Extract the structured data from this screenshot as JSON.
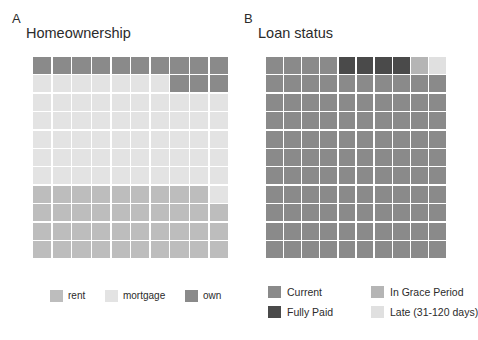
{
  "figure": {
    "background": "#ffffff"
  },
  "panels": [
    {
      "letter": "A",
      "title": "Homeownership",
      "legend": [
        {
          "label": "rent",
          "color": "#bdbdbd"
        },
        {
          "label": "mortgage",
          "color": "#e3e3e3"
        },
        {
          "label": "own",
          "color": "#8a8a8a"
        }
      ]
    },
    {
      "letter": "B",
      "title": "Loan status",
      "legend": [
        {
          "label": "Current",
          "color": "#8a8a8a"
        },
        {
          "label": "In Grace Period",
          "color": "#b5b5b5"
        },
        {
          "label": "Fully Paid",
          "color": "#4a4a4a"
        },
        {
          "label": "Late (31-120 days)",
          "color": "#e0e0e0"
        }
      ]
    }
  ],
  "chart_data": [
    {
      "type": "waffle",
      "title": "Homeownership",
      "panel": "A",
      "rows": 11,
      "columns": 10,
      "total_cells": 110,
      "fill_order": "top-left to bottom-right, row-major",
      "categories": [
        "own",
        "mortgage",
        "rent"
      ],
      "colors": {
        "own": "#8a8a8a",
        "mortgage": "#e3e3e3",
        "rent": "#bdbdbd"
      },
      "counts": {
        "own": 13,
        "mortgage": 57,
        "rent": 40
      },
      "percentages": {
        "own": 11.8,
        "mortgage": 51.8,
        "rent": 36.4
      },
      "cells": [
        "own",
        "own",
        "own",
        "own",
        "own",
        "own",
        "own",
        "own",
        "own",
        "own",
        "mortgage",
        "mortgage",
        "mortgage",
        "mortgage",
        "mortgage",
        "mortgage",
        "mortgage",
        "own",
        "own",
        "own",
        "mortgage",
        "mortgage",
        "mortgage",
        "mortgage",
        "mortgage",
        "mortgage",
        "mortgage",
        "mortgage",
        "mortgage",
        "mortgage",
        "mortgage",
        "mortgage",
        "mortgage",
        "mortgage",
        "mortgage",
        "mortgage",
        "mortgage",
        "mortgage",
        "mortgage",
        "mortgage",
        "mortgage",
        "mortgage",
        "mortgage",
        "mortgage",
        "mortgage",
        "mortgage",
        "mortgage",
        "mortgage",
        "mortgage",
        "mortgage",
        "mortgage",
        "mortgage",
        "mortgage",
        "mortgage",
        "mortgage",
        "mortgage",
        "mortgage",
        "mortgage",
        "mortgage",
        "mortgage",
        "mortgage",
        "mortgage",
        "mortgage",
        "mortgage",
        "mortgage",
        "mortgage",
        "mortgage",
        "mortgage",
        "mortgage",
        "mortgage",
        "rent",
        "rent",
        "rent",
        "rent",
        "rent",
        "rent",
        "rent",
        "rent",
        "rent",
        "mortgage",
        "rent",
        "rent",
        "rent",
        "rent",
        "rent",
        "rent",
        "rent",
        "rent",
        "rent",
        "rent",
        "rent",
        "rent",
        "rent",
        "rent",
        "rent",
        "rent",
        "rent",
        "rent",
        "rent",
        "rent",
        "rent",
        "rent",
        "rent",
        "rent",
        "rent",
        "rent",
        "rent",
        "rent",
        "rent",
        "rent"
      ]
    },
    {
      "type": "waffle",
      "title": "Loan status",
      "panel": "B",
      "rows": 11,
      "columns": 10,
      "total_cells": 110,
      "fill_order": "top-left to bottom-right, row-major",
      "categories": [
        "Current",
        "Fully Paid",
        "In Grace Period",
        "Late (31-120 days)"
      ],
      "colors": {
        "Current": "#8a8a8a",
        "Fully Paid": "#4a4a4a",
        "In Grace Period": "#b5b5b5",
        "Late (31-120 days)": "#e0e0e0"
      },
      "counts": {
        "Current": 104,
        "Fully Paid": 4,
        "In Grace Period": 1,
        "Late (31-120 days)": 1
      },
      "percentages": {
        "Current": 94.5,
        "Fully Paid": 3.6,
        "In Grace Period": 0.9,
        "Late (31-120 days)": 0.9
      },
      "cells": [
        "Current",
        "Current",
        "Current",
        "Current",
        "Fully Paid",
        "Fully Paid",
        "Fully Paid",
        "Fully Paid",
        "In Grace Period",
        "Late (31-120 days)",
        "Current",
        "Current",
        "Current",
        "Current",
        "Current",
        "Current",
        "Current",
        "Current",
        "Current",
        "Current",
        "Current",
        "Current",
        "Current",
        "Current",
        "Current",
        "Current",
        "Current",
        "Current",
        "Current",
        "Current",
        "Current",
        "Current",
        "Current",
        "Current",
        "Current",
        "Current",
        "Current",
        "Current",
        "Current",
        "Current",
        "Current",
        "Current",
        "Current",
        "Current",
        "Current",
        "Current",
        "Current",
        "Current",
        "Current",
        "Current",
        "Current",
        "Current",
        "Current",
        "Current",
        "Current",
        "Current",
        "Current",
        "Current",
        "Current",
        "Current",
        "Current",
        "Current",
        "Current",
        "Current",
        "Current",
        "Current",
        "Current",
        "Current",
        "Current",
        "Current",
        "Current",
        "Current",
        "Current",
        "Current",
        "Current",
        "Current",
        "Current",
        "Current",
        "Current",
        "Current",
        "Current",
        "Current",
        "Current",
        "Current",
        "Current",
        "Current",
        "Current",
        "Current",
        "Current",
        "Current",
        "Current",
        "Current",
        "Current",
        "Current",
        "Current",
        "Current",
        "Current",
        "Current",
        "Current",
        "Current",
        "Current",
        "Current",
        "Current",
        "Current",
        "Current",
        "Current",
        "Current",
        "Current",
        "Current",
        "Current"
      ]
    }
  ]
}
